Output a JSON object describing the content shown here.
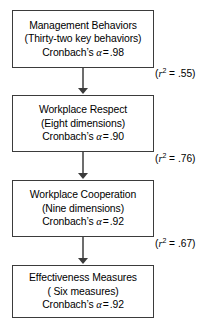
{
  "diagram": {
    "type": "flowchart-vertical-path-model",
    "colors": {
      "background": "#ffffff",
      "box_border": "#3b3b3b",
      "box_fill": "#ffffff",
      "connector": "#6d6d6d",
      "text": "#000000"
    },
    "nodes": [
      {
        "id": "management-behaviors",
        "line1": "Management Behaviors",
        "line2": "(Thirty-two key behaviors)",
        "reliability_label": "Cronbach’s",
        "reliability_symbol": "α",
        "reliability_equals": "=",
        "reliability_value": ".98"
      },
      {
        "id": "workplace-respect",
        "line1": "Workplace Respect",
        "line2": "(Eight dimensions)",
        "reliability_label": "Cronbach’s",
        "reliability_symbol": "α",
        "reliability_equals": "=",
        "reliability_value": ".90"
      },
      {
        "id": "workplace-cooperation",
        "line1": "Workplace Cooperation",
        "line2": "(Nine dimensions)",
        "reliability_label": "Cronbach’s",
        "reliability_symbol": "α",
        "reliability_equals": "=",
        "reliability_value": ".92"
      },
      {
        "id": "effectiveness-measures",
        "line1": "Effectiveness Measures",
        "line2": "( Six measures)",
        "reliability_label": "Cronbach’s",
        "reliability_symbol": "α",
        "reliability_equals": "=",
        "reliability_value": ".92"
      }
    ],
    "edges": [
      {
        "id": "edge-0",
        "from": "management-behaviors",
        "to": "workplace-respect",
        "open_paren": "(",
        "var": "r",
        "exponent": "2",
        "equals": " = ",
        "value": ".55",
        "close_paren": ")"
      },
      {
        "id": "edge-1",
        "from": "workplace-respect",
        "to": "workplace-cooperation",
        "open_paren": "(",
        "var": "r",
        "exponent": "2",
        "equals": " = ",
        "value": ".76",
        "close_paren": ")"
      },
      {
        "id": "edge-2",
        "from": "workplace-cooperation",
        "to": "effectiveness-measures",
        "open_paren": "(",
        "var": "r",
        "exponent": "2",
        "equals": " = ",
        "value": ".67",
        "close_paren": ")"
      }
    ]
  }
}
